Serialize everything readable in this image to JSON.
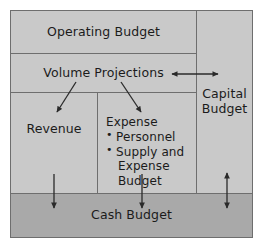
{
  "diagram": {
    "type": "block-flow-diagram",
    "colors": {
      "panel_fill": "#c9c9c9",
      "cash_budget_fill": "#a9a9a9",
      "line": "#6e6e6e",
      "arrow": "#2a2a2a",
      "text": "#1b1b1b",
      "page_background": "#ffffff"
    },
    "blocks": {
      "operating_budget": {
        "label": "Operating Budget"
      },
      "volume_projections": {
        "label": "Volume Projections"
      },
      "revenue": {
        "label": "Revenue"
      },
      "expense": {
        "label": "Expense",
        "items": [
          {
            "line1": "Personnel",
            "line2": ""
          },
          {
            "line1": "Supply and",
            "line2": "Expense Budget"
          }
        ]
      },
      "capital_budget": {
        "line1": "Capital",
        "line2": "Budget"
      },
      "cash_budget": {
        "label": "Cash Budget"
      }
    },
    "connectors": [
      {
        "name": "volume-projections-to-capital-budget",
        "style": "double-headed",
        "orientation": "horizontal"
      },
      {
        "name": "volume-projections-to-revenue",
        "style": "single-headed",
        "orientation": "diagonal-down-left"
      },
      {
        "name": "volume-projections-to-expense",
        "style": "single-headed",
        "orientation": "diagonal-down-right"
      },
      {
        "name": "revenue-to-cash-budget",
        "style": "single-headed",
        "orientation": "vertical-down"
      },
      {
        "name": "expense-to-cash-budget",
        "style": "single-headed",
        "orientation": "vertical-down"
      },
      {
        "name": "capital-budget-to-cash-budget",
        "style": "double-headed",
        "orientation": "vertical"
      }
    ]
  }
}
